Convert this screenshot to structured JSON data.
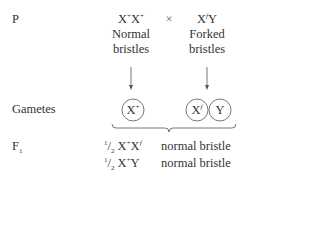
{
  "rows": {
    "p_label": "P",
    "gametes_label": "Gametes",
    "f1_label": "F",
    "f1_sub": "1"
  },
  "parents": {
    "female": {
      "genotype_base1": "X",
      "genotype_sup1": "+",
      "genotype_base2": "X",
      "genotype_sup2": "+",
      "phenotype_line1": "Normal",
      "phenotype_line2": "bristles"
    },
    "cross_symbol": "×",
    "male": {
      "genotype_base1": "X",
      "genotype_sup1": "f",
      "genotype_base2": "Y",
      "phenotype_line1": "Forked",
      "phenotype_line2": "bristles"
    }
  },
  "gametes": [
    {
      "base": "X",
      "sup": "+"
    },
    {
      "base": "X",
      "sup": "f"
    },
    {
      "base": "Y",
      "sup": ""
    }
  ],
  "offspring": [
    {
      "fraction_num": "1",
      "fraction_den": "2",
      "base1": "X",
      "sup1": "+",
      "base2": "X",
      "sup2": "f",
      "phenotype": "normal bristle"
    },
    {
      "fraction_num": "1",
      "fraction_den": "2",
      "base1": "X",
      "sup1": "+",
      "base2": "Y",
      "sup2": "",
      "phenotype": "normal bristle"
    }
  ]
}
